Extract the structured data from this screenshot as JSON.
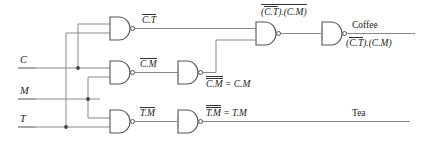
{
  "diagram": {
    "stroke_color": "#555555",
    "text_color": "#222222",
    "background": "#ffffff"
  },
  "inputs": [
    {
      "label": "C",
      "name": "input-c"
    },
    {
      "label": "M",
      "name": "input-m"
    },
    {
      "label": "T",
      "name": "input-t"
    }
  ],
  "gates": [
    {
      "name": "nand-ct",
      "type": "NAND",
      "row": "top"
    },
    {
      "name": "nand-cm",
      "type": "NAND",
      "row": "middle"
    },
    {
      "name": "nand-tm",
      "type": "NAND",
      "row": "bottom"
    },
    {
      "name": "nand-cm-inverter",
      "type": "NAND",
      "row": "middle"
    },
    {
      "name": "nand-tm-inverter",
      "type": "NAND",
      "row": "bottom"
    },
    {
      "name": "nand-combine",
      "type": "NAND",
      "row": "top"
    },
    {
      "name": "nand-coffee",
      "type": "NAND",
      "row": "top"
    }
  ],
  "labels": {
    "ct_bar": {
      "overline": "C.T",
      "tail": ""
    },
    "cm_bar": {
      "overline": "C.M",
      "tail": ""
    },
    "tm_bar": {
      "overline": "T.M",
      "tail": ""
    },
    "cm_double": {
      "overline": "C.M",
      "tail": " = C.M"
    },
    "tm_double": {
      "overline": "T.M",
      "tail": " = T.M"
    },
    "combine": {
      "open": "(",
      "inner": "C.T",
      "close_rest": ").(C.M)"
    },
    "coffee_expr": {
      "open": "(",
      "inner": "C.T",
      "close_rest": ").(C.M)"
    }
  },
  "outputs": [
    {
      "label": "Coffee",
      "name": "output-coffee"
    },
    {
      "label": "Tea",
      "name": "output-tea"
    }
  ]
}
